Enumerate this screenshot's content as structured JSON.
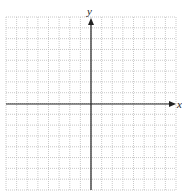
{
  "chart_data": {
    "type": "scatter",
    "title": "",
    "xlabel": "x",
    "ylabel": "y",
    "grid": true,
    "grid_columns": 16,
    "grid_rows": 16,
    "xlim": [
      -8,
      8
    ],
    "ylim": [
      -8,
      8
    ],
    "series": [],
    "axis_color": "#222222",
    "grid_color": "#bbbbbb"
  },
  "labels": {
    "x_axis": "x",
    "y_axis": "y"
  }
}
